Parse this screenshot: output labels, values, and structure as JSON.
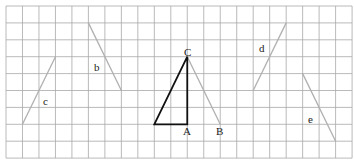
{
  "diagram": {
    "grid": {
      "origin_x": 6,
      "origin_y": 6,
      "cell_w": 16.48,
      "cell_h": 16.9,
      "cols": 21,
      "rows": 9,
      "line_color": "#a8a8a8"
    },
    "triangle": {
      "color": "#111111",
      "vertices": [
        {
          "name": "bottom-left",
          "col": 9,
          "row": 7
        },
        {
          "name": "A",
          "col": 11,
          "row": 7
        },
        {
          "name": "C",
          "col": 11,
          "row": 3
        }
      ]
    },
    "segments": [
      {
        "id": "b",
        "label": "b",
        "from": {
          "col": 5,
          "row": 1
        },
        "to": {
          "col": 7,
          "row": 5
        },
        "label_pos": {
          "x": 94,
          "y": 71
        },
        "color": "#b0b0b0"
      },
      {
        "id": "c",
        "label": "c",
        "from": {
          "col": 1,
          "row": 7
        },
        "to": {
          "col": 3,
          "row": 3
        },
        "label_pos": {
          "x": 43,
          "y": 105
        },
        "color": "#b0b0b0"
      },
      {
        "id": "CB",
        "label": "",
        "from": {
          "col": 11,
          "row": 3
        },
        "to": {
          "col": 13,
          "row": 7
        },
        "label_pos": null,
        "color": "#b0b0b0"
      },
      {
        "id": "d",
        "label": "d",
        "from": {
          "col": 15,
          "row": 5
        },
        "to": {
          "col": 17,
          "row": 1
        },
        "label_pos": {
          "x": 259,
          "y": 52
        },
        "color": "#b0b0b0"
      },
      {
        "id": "e",
        "label": "e",
        "from": {
          "col": 18,
          "row": 4
        },
        "to": {
          "col": 20,
          "row": 8
        },
        "label_pos": {
          "x": 308,
          "y": 123
        },
        "color": "#b0b0b0"
      }
    ],
    "point_labels": [
      {
        "label": "C",
        "x": 184,
        "y": 56
      },
      {
        "label": "A",
        "x": 183,
        "y": 135
      },
      {
        "label": "B",
        "x": 216,
        "y": 135
      }
    ]
  }
}
